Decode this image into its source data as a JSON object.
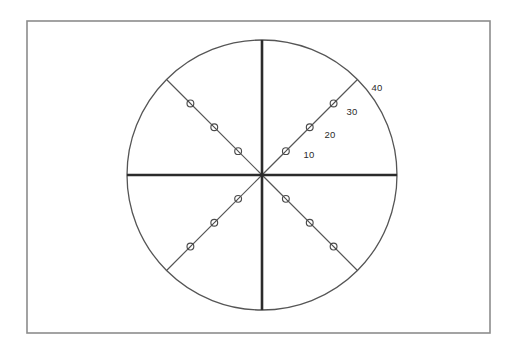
{
  "figure": {
    "background_color": "#ffffff",
    "frame": {
      "name": "outer-frame",
      "x": 27,
      "y": 21,
      "width": 463,
      "height": 312,
      "stroke_color": "#8c8c8c"
    },
    "center": {
      "x": 262,
      "y": 175
    },
    "radius": 135
  },
  "chart_data": {
    "type": "scatter",
    "subtype": "polar",
    "title": "",
    "subtitle": "",
    "xlabel": "",
    "ylabel": "",
    "grid": false,
    "legend": false,
    "radial_axis": {
      "min": 0,
      "max": 40,
      "tick_values": [
        10,
        20,
        30,
        40
      ],
      "tick_labels": [
        "10",
        "20",
        "30",
        "40"
      ],
      "tick_label_color": "#2b2b2b",
      "label_angle_deg": 45
    },
    "angular_axis": {
      "spoke_count": 8,
      "spoke_angles_deg": [
        0,
        45,
        90,
        135,
        180,
        225,
        270,
        315
      ],
      "major_spoke_angles_deg": [
        0,
        90,
        180,
        270
      ],
      "major_spoke_color": "#2b2b2b",
      "minor_spoke_color": "#555555"
    },
    "outline_circle": {
      "radius_value": 40,
      "color": "#555555"
    },
    "marker_style": {
      "shape": "slashed-circle",
      "fill": "#ffffff",
      "stroke": "#4a4a4a",
      "radius_px": 3.4
    },
    "series": [
      {
        "name": "spoke-45",
        "angle_deg": 45,
        "values": [
          10,
          20,
          30
        ]
      },
      {
        "name": "spoke-135",
        "angle_deg": 135,
        "values": [
          10,
          20,
          30
        ]
      },
      {
        "name": "spoke-225",
        "angle_deg": 225,
        "values": [
          10,
          20,
          30
        ]
      },
      {
        "name": "spoke-315",
        "angle_deg": 315,
        "values": [
          10,
          20,
          30
        ]
      }
    ],
    "radial_tick_label_positions": [
      {
        "label": "10",
        "value": 10,
        "x": 309,
        "y": 155
      },
      {
        "label": "20",
        "value": 20,
        "x": 330,
        "y": 135
      },
      {
        "label": "30",
        "value": 30,
        "x": 352,
        "y": 112
      },
      {
        "label": "40",
        "value": 40,
        "x": 377,
        "y": 88
      }
    ]
  }
}
